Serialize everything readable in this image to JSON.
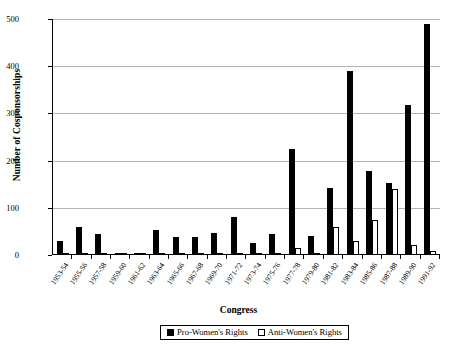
{
  "chart_data": {
    "type": "bar",
    "title": "",
    "xlabel": "Congress",
    "ylabel": "Number of Cosponsorships",
    "ylim": [
      0,
      500
    ],
    "yticks": [
      0,
      100,
      200,
      300,
      400,
      500
    ],
    "grid": true,
    "legend_position": "bottom",
    "categories": [
      "1953-54",
      "1955-56",
      "1957-58",
      "1959-60",
      "1961-62",
      "1963-64",
      "1965-66",
      "1967-68",
      "1969-70",
      "1971-72",
      "1973-74",
      "1975-76",
      "1977-78",
      "1979-80",
      "1981-82",
      "1983-84",
      "1985-86",
      "1987-88",
      "1989-90",
      "1991-92"
    ],
    "series": [
      {
        "name": "Pro-Women's Rights",
        "color": "#000000",
        "values": [
          30,
          60,
          44,
          5,
          4,
          52,
          38,
          38,
          47,
          80,
          25,
          45,
          225,
          40,
          142,
          390,
          178,
          152,
          318,
          490
        ]
      },
      {
        "name": "Anti-Women's Rights",
        "color": "#ffffff",
        "values": [
          0,
          0,
          0,
          0,
          0,
          0,
          0,
          0,
          0,
          0,
          0,
          0,
          14,
          0,
          60,
          30,
          75,
          140,
          22,
          8
        ]
      }
    ]
  },
  "axis": {
    "y_title": "Number of Cosponsorships",
    "x_title": "Congress",
    "y_tick_labels": [
      "500",
      "400",
      "300",
      "200",
      "100",
      "0"
    ]
  },
  "legend": {
    "items": [
      {
        "label": "Pro-Women's Rights",
        "swatch": "filled-black-square"
      },
      {
        "label": "Anti-Women's Rights",
        "swatch": "open-white-square"
      }
    ]
  }
}
